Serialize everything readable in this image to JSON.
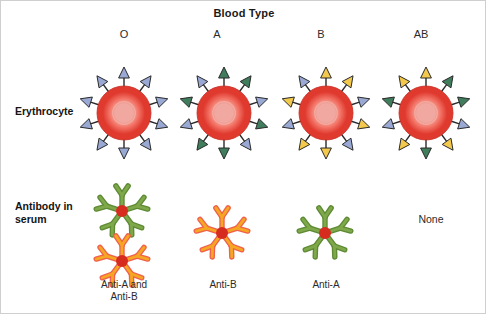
{
  "title": "Blood Type",
  "rows": {
    "erythrocyte_label": "Erythrocyte",
    "antibody_label": "Antibody in serum"
  },
  "colors": {
    "cell_rim": "#e03a2f",
    "cell_mid": "#f4776a",
    "cell_center": "#f0a8a0",
    "cell_outline": "#c62a20",
    "antigen_blue": "#9aa8d4",
    "antigen_green": "#3f7d5c",
    "antigen_yellow": "#f2c94c",
    "antigen_outline": "#2a2a2a",
    "antibody_green": "#7fa84a",
    "antibody_orange": "#f5a623",
    "antibody_orange_edge": "#f0604d",
    "antibody_hub": "#d62b1f",
    "text": "#1a1a1a",
    "background": "#ffffff",
    "frame": "#cfcfcf"
  },
  "columns": [
    {
      "id": "o",
      "header": "O",
      "antigens": [
        "blue",
        "blue",
        "blue",
        "blue",
        "blue",
        "blue",
        "blue",
        "blue",
        "blue",
        "blue"
      ],
      "antibodies": [
        "green",
        "orange"
      ],
      "antibody_caption": "Anti-A and\nAnti-B"
    },
    {
      "id": "a",
      "header": "A",
      "antigens": [
        "green",
        "green",
        "blue",
        "green",
        "blue",
        "green",
        "green",
        "blue",
        "green",
        "blue"
      ],
      "antibodies": [
        "orange"
      ],
      "antibody_caption": "Anti-B"
    },
    {
      "id": "b",
      "header": "B",
      "antigens": [
        "yellow",
        "yellow",
        "blue",
        "yellow",
        "blue",
        "yellow",
        "yellow",
        "blue",
        "yellow",
        "blue"
      ],
      "antibodies": [
        "green"
      ],
      "antibody_caption": "Anti-A"
    },
    {
      "id": "ab",
      "header": "AB",
      "antigens": [
        "yellow",
        "green",
        "green",
        "blue",
        "yellow",
        "green",
        "yellow",
        "blue",
        "green",
        "yellow"
      ],
      "antibodies": [],
      "antibody_caption": "",
      "antibody_none_text": "None"
    }
  ],
  "icons": {
    "erythrocyte": "red-blood-cell-icon",
    "antigen": "antigen-arrow-icon",
    "antibody": "antibody-star-icon"
  }
}
